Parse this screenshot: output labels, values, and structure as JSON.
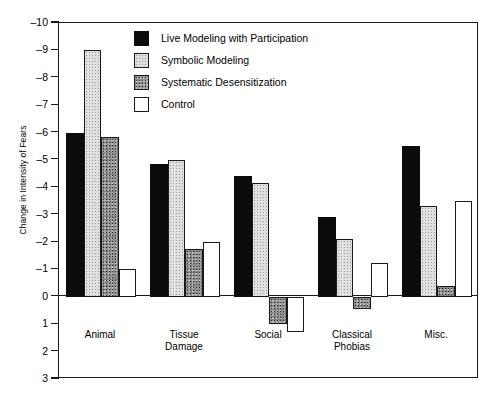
{
  "chart_data": {
    "type": "bar",
    "title": "",
    "xlabel": "",
    "ylabel": "Change in Intensity of Fears",
    "categories": [
      "Animal",
      "Tissue\nDamage",
      "Social",
      "Classical\nPhobias",
      "Misc."
    ],
    "ylim": [
      -10,
      3
    ],
    "y_axis_inverted": true,
    "yticks": [
      -10,
      -9,
      -8,
      -7,
      -6,
      -5,
      -4,
      -3,
      -2,
      -1,
      0,
      1,
      2,
      3
    ],
    "ytick_labels": [
      "–10",
      "–9",
      "–8",
      "–7",
      "–6",
      "–5",
      "–4",
      "–3",
      "–2",
      "–1",
      "0",
      "1",
      "2",
      "3"
    ],
    "grid": false,
    "legend_position": "upper center inside",
    "series": [
      {
        "name": "Live Modeling with Participation",
        "color": "#0b0b0b",
        "fill": "solid-black",
        "values": [
          -6.0,
          -4.85,
          -4.4,
          -2.9,
          -5.5
        ]
      },
      {
        "name": "Symbolic Modeling",
        "color": "#dedede",
        "fill": "light-stipple",
        "values": [
          -9.0,
          -5.0,
          -4.15,
          -2.1,
          -3.3
        ]
      },
      {
        "name": "Systematic Desensitization",
        "color": "#8d8d8d",
        "fill": "dark-stipple",
        "values": [
          -5.85,
          -1.75,
          1.0,
          0.45,
          -0.4
        ]
      },
      {
        "name": "Control",
        "color": "#ffffff",
        "fill": "open-white",
        "values": [
          -1.0,
          -2.0,
          1.3,
          -1.25,
          -3.5
        ]
      }
    ]
  },
  "axes": {
    "frame_color": "#1a1a1a"
  }
}
